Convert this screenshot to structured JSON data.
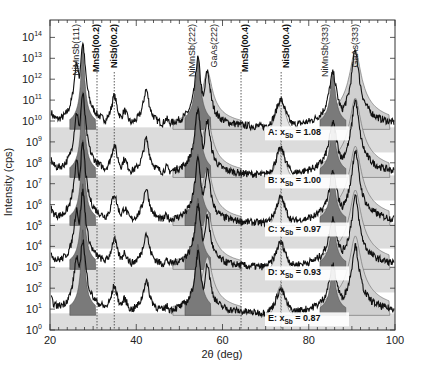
{
  "chart_data": {
    "type": "line",
    "title": "",
    "xlabel": "2θ (deg)",
    "ylabel": "Intensity (cps)",
    "xlim": [
      20,
      100
    ],
    "ylim_log10": [
      0,
      14.6
    ],
    "yscale": "log",
    "x_ticks": [
      "20",
      "40",
      "60",
      "80",
      "100"
    ],
    "y_ticks": [
      "10^0",
      "10^1",
      "10^2",
      "10^3",
      "10^4",
      "10^5",
      "10^6",
      "10^7",
      "10^8",
      "10^9",
      "10^10",
      "10^11",
      "10^12",
      "10^13",
      "10^14"
    ],
    "grid": false,
    "peak_annotations": [
      {
        "label": "NiMnSb(111)",
        "x": 27.5,
        "bold": false
      },
      {
        "label": "MnSb(00.2)",
        "x": 30.9,
        "bold": true,
        "dotted_line": true
      },
      {
        "label": "NiSb(00.2)",
        "x": 34.9,
        "bold": true,
        "dotted_line": true
      },
      {
        "label": "NiMnSb(222)",
        "x": 54.5,
        "bold": false
      },
      {
        "label": "GaAs(222)",
        "x": 58.0,
        "bold": false
      },
      {
        "label": "MnSb(00.4)",
        "x": 64.3,
        "bold": true,
        "dotted_line": true
      },
      {
        "label": "NiSb(00.4)",
        "x": 73.6,
        "bold": true,
        "dotted_line": true
      },
      {
        "label": "NiMnSb(333)",
        "x": 85.7,
        "bold": false
      },
      {
        "label": "GaAs(333)",
        "x": 90.5,
        "bold": false
      }
    ],
    "series": [
      {
        "name": "A",
        "x_Sb": "1.08",
        "label": "A:  x_Sb = 1.08",
        "baseline_log10": 9.6,
        "offset_decades": 8
      },
      {
        "name": "B",
        "x_Sb": "1.00",
        "label": "B:  x_Sb = 1.00",
        "baseline_log10": 7.3,
        "offset_decades": 6
      },
      {
        "name": "C",
        "x_Sb": "0.97",
        "label": "C:  x_Sb = 0.97",
        "baseline_log10": 5.0,
        "offset_decades": 4
      },
      {
        "name": "D",
        "x_Sb": "0.93",
        "label": "D:  x_Sb = 0.93",
        "baseline_log10": 2.9,
        "offset_decades": 2
      },
      {
        "name": "E",
        "x_Sb": "0.87",
        "label": "E:  x_Sb = 0.87",
        "baseline_log10": 0.7,
        "offset_decades": 0
      }
    ],
    "peaks_relative_to_baseline_decades": [
      {
        "x": 26.2,
        "height": 3.2
      },
      {
        "x": 27.6,
        "height": 4.1
      },
      {
        "x": 31.0,
        "height": 0.6
      },
      {
        "x": 34.9,
        "height": 1.6
      },
      {
        "x": 37.3,
        "height": 0.9
      },
      {
        "x": 42.3,
        "height": 1.9
      },
      {
        "x": 47.0,
        "height": 0.5
      },
      {
        "x": 54.3,
        "height": 3.4
      },
      {
        "x": 56.5,
        "height": 2.8
      },
      {
        "x": 73.5,
        "height": 1.4
      },
      {
        "x": 85.6,
        "height": 2.7
      },
      {
        "x": 90.8,
        "height": 3.8
      }
    ]
  },
  "axes": {
    "xlabel": "2θ (deg)",
    "ylabel": "Intensity (cps)",
    "x_tick_labels": [
      "20",
      "40",
      "60",
      "80",
      "100"
    ],
    "y_tick_exponents": [
      "0",
      "1",
      "2",
      "3",
      "4",
      "5",
      "6",
      "7",
      "8",
      "9",
      "10",
      "11",
      "12",
      "13",
      "14"
    ]
  },
  "annotations": {
    "nimnsb111": "NiMnSb(111)",
    "mnsb002": "MnSb(00.2)",
    "nisb002": "NiSb(00.2)",
    "nimnsb222": "NiMnSb(222)",
    "gaas222": "GaAs(222)",
    "mnsb004": "MnSb(00.4)",
    "nisb004": "NiSb(00.4)",
    "nimnsb333": "NiMnSb(333)",
    "gaas333": "GaAs(333)"
  },
  "sample_labels": [
    {
      "prefix": "A:  x",
      "sub": "Sb",
      "value": " = 1.08"
    },
    {
      "prefix": "B:  x",
      "sub": "Sb",
      "value": " = 1.00"
    },
    {
      "prefix": "C:  x",
      "sub": "Sb",
      "value": " = 0.97"
    },
    {
      "prefix": "D:  x",
      "sub": "Sb",
      "value": " = 0.93"
    },
    {
      "prefix": "E:  x",
      "sub": "Sb",
      "value": " = 0.87"
    }
  ],
  "colors": {
    "band_fill": "#dcdcdc",
    "substrate_fill": "#d0d0d0",
    "film_peak_fill": "#7a7a7a",
    "trace": "#111111",
    "axis": "#333333"
  }
}
